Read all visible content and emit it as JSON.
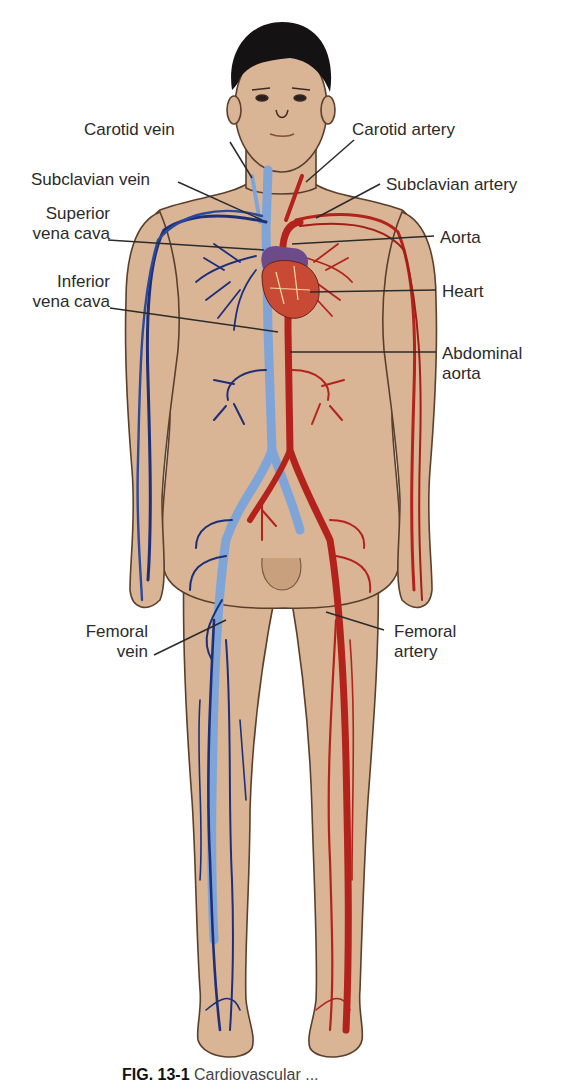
{
  "figure": {
    "colors": {
      "skin": "#d9b596",
      "skin_outline": "#5a3f2c",
      "hair": "#141212",
      "vein_dark": "#1e2f7a",
      "vein_light": "#7fa5d8",
      "artery": "#b3231c",
      "heart": "#c94a34",
      "heart_purple": "#6d4a8a",
      "leader_line": "#2b2b2b",
      "label_text": "#2b2b2b"
    },
    "labels_left": [
      {
        "id": "carotid-vein",
        "lines": [
          "Carotid vein"
        ]
      },
      {
        "id": "subclavian-vein",
        "lines": [
          "Subclavian vein"
        ]
      },
      {
        "id": "superior-vena-cava",
        "lines": [
          "Superior",
          "vena cava"
        ]
      },
      {
        "id": "inferior-vena-cava",
        "lines": [
          "Inferior",
          "vena cava"
        ]
      },
      {
        "id": "femoral-vein",
        "lines": [
          "Femoral",
          "vein"
        ]
      }
    ],
    "labels_right": [
      {
        "id": "carotid-artery",
        "lines": [
          "Carotid artery"
        ]
      },
      {
        "id": "subclavian-artery",
        "lines": [
          "Subclavian artery"
        ]
      },
      {
        "id": "aorta",
        "lines": [
          "Aorta"
        ]
      },
      {
        "id": "heart",
        "lines": [
          "Heart"
        ]
      },
      {
        "id": "abdominal-aorta",
        "lines": [
          "Abdominal",
          "aorta"
        ]
      },
      {
        "id": "femoral-artery",
        "lines": [
          "Femoral",
          "artery"
        ]
      }
    ]
  },
  "caption": {
    "fig_number": "FIG. 13-1",
    "text_truncated": "Cardiovascular ..."
  }
}
